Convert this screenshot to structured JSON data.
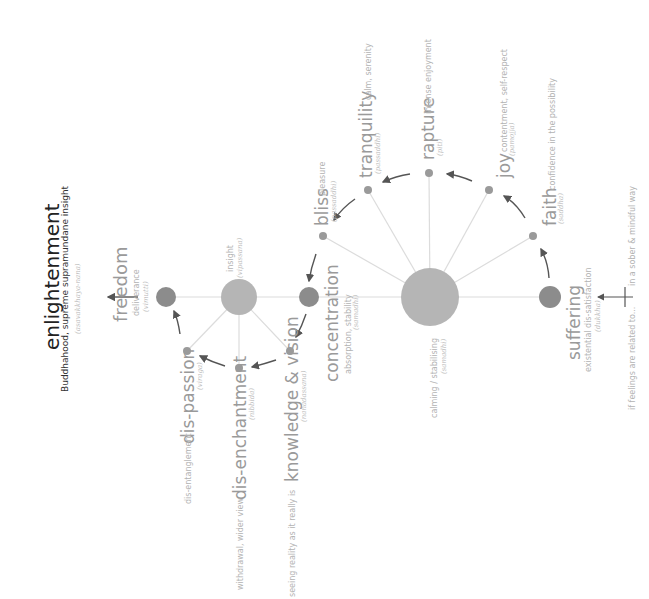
{
  "diagram": {
    "orientation": "rotated -90deg (text reads bottom-to-top)",
    "colors": {
      "node_dark": "#8c8c8c",
      "node_light": "#b5b5b5",
      "connector": "#dcdcdc",
      "arrow": "#555555",
      "text": "#a9a9a9",
      "title": "#222222"
    },
    "intro": {
      "left": "if feelings are related to...",
      "right": "in a sober & mindful way"
    },
    "hub_samadhi": {
      "label": "calming / stabilising",
      "pali": "(samadhi)"
    },
    "hub_insight": {
      "label": "insight",
      "pali": "(vipassana)"
    },
    "nodes": [
      {
        "name": "suffering",
        "desc": "existential dis-satisfaction",
        "pali": "(dukkha)"
      },
      {
        "name": "faith",
        "desc": "confidence in the possibility",
        "pali": "(saddha)"
      },
      {
        "name": "joy",
        "desc": "contentment, self-respect",
        "pali": "(pamojja)"
      },
      {
        "name": "rapture",
        "desc": "intense enjoyment",
        "pali": "(piti)"
      },
      {
        "name": "tranquility",
        "desc": "calm, serenity",
        "pali": "(passaddhi)"
      },
      {
        "name": "bliss",
        "desc": "pleasure",
        "pali": "(passaddhi)"
      },
      {
        "name": "concentration",
        "desc": "absorption, stability",
        "pali": "(samadhi)"
      },
      {
        "name": "knowledge & vision",
        "desc": "seeing reality as it really is",
        "pali": "(nanadassana)"
      },
      {
        "name": "dis-enchantment",
        "desc": "withdrawal, wider view",
        "pali": "(nibbida)"
      },
      {
        "name": "dis-passion",
        "desc": "dis-entanglement",
        "pali": "(viraga)"
      },
      {
        "name": "freedom",
        "desc": "deliverance",
        "pali": "(vimutti)"
      }
    ],
    "goal": {
      "name": "enlightenment",
      "desc": "Buddhahood, supreme supramundane insight",
      "pali": "(asavakkhaya-nana)"
    }
  }
}
